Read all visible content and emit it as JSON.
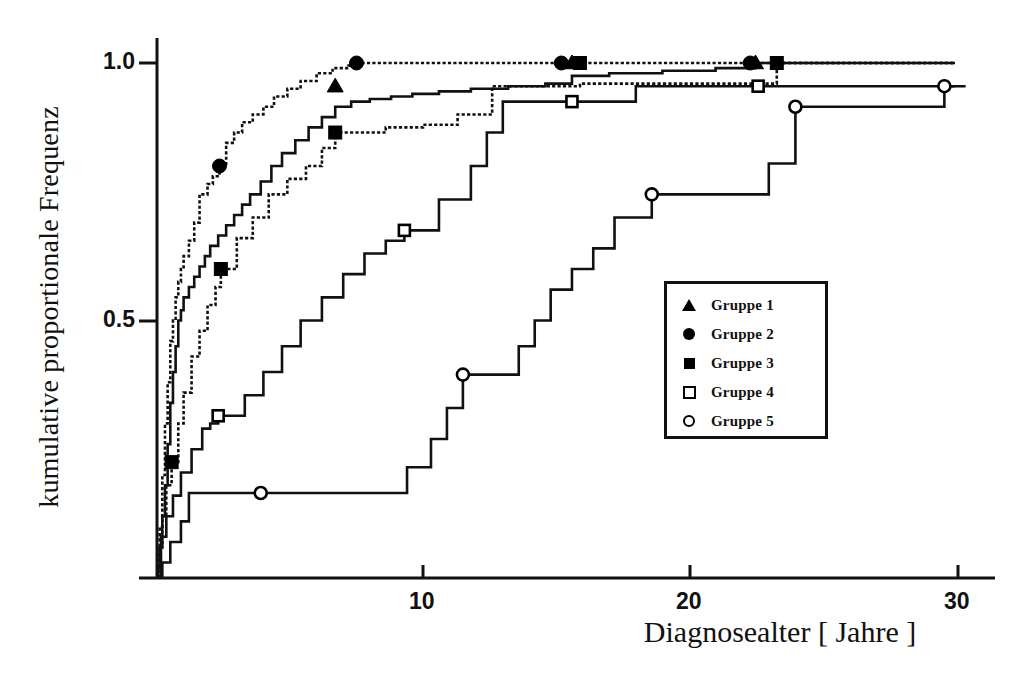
{
  "figure": {
    "title": "",
    "axis": {
      "x_label": "Diagnosealter  [  Jahre  ]",
      "y_label": "kumulative proportionale Frequenz",
      "x_ticks": [
        "10",
        "20",
        "30"
      ],
      "y_ticks": [
        "0.5",
        "1.0"
      ]
    },
    "legend": {
      "items": [
        {
          "label": "Gruppe 1",
          "marker": "filled-triangle-icon"
        },
        {
          "label": "Gruppe 2",
          "marker": "filled-circle-icon"
        },
        {
          "label": "Gruppe 3",
          "marker": "filled-square-icon"
        },
        {
          "label": "Gruppe 4",
          "marker": "open-square-icon"
        },
        {
          "label": "Gruppe 5",
          "marker": "open-circle-icon"
        }
      ]
    }
  },
  "chart_data": {
    "type": "line",
    "title": "",
    "subtitle": "",
    "xlabel": "Diagnosealter  [  Jahre  ]",
    "ylabel": "kumulative proportionale Frequenz",
    "xlim": [
      0,
      31.2
    ],
    "ylim": [
      0,
      1.06
    ],
    "xticks": [
      10,
      20,
      30
    ],
    "yticks": [
      0.5,
      1.0
    ],
    "grid": false,
    "legend_position": "center-right",
    "step_style": "post",
    "series": [
      {
        "name": "Gruppe 1",
        "marker": "filled-triangle",
        "filled": true,
        "line_style": "solid",
        "markers_at": [
          {
            "x": 6.7,
            "y": 0.955
          },
          {
            "x": 15.6,
            "y": 1.0
          },
          {
            "x": 22.5,
            "y": 1.0
          }
        ],
        "x": [
          0.05,
          0.1,
          0.2,
          0.3,
          0.4,
          0.5,
          0.6,
          0.7,
          0.8,
          0.9,
          1.0,
          1.2,
          1.4,
          1.6,
          1.8,
          2.0,
          2.3,
          2.6,
          2.9,
          3.2,
          3.5,
          3.9,
          4.3,
          4.7,
          5.2,
          5.7,
          6.2,
          6.7,
          7.3,
          8.0,
          8.8,
          9.6,
          10.6,
          11.8,
          13.2,
          14.6,
          15.6,
          17.0,
          19.0,
          21.0,
          22.5,
          24.0,
          30.0
        ],
        "y": [
          0.02,
          0.06,
          0.12,
          0.18,
          0.26,
          0.34,
          0.4,
          0.45,
          0.5,
          0.52,
          0.545,
          0.565,
          0.585,
          0.605,
          0.625,
          0.645,
          0.665,
          0.685,
          0.705,
          0.725,
          0.745,
          0.77,
          0.8,
          0.825,
          0.85,
          0.875,
          0.895,
          0.915,
          0.925,
          0.93,
          0.935,
          0.94,
          0.945,
          0.95,
          0.955,
          0.96,
          0.975,
          0.98,
          0.985,
          0.99,
          1.0,
          1.0,
          1.0
        ]
      },
      {
        "name": "Gruppe 2",
        "marker": "filled-circle",
        "filled": true,
        "line_style": "dotted",
        "markers_at": [
          {
            "x": 2.35,
            "y": 0.8
          },
          {
            "x": 7.5,
            "y": 1.0
          },
          {
            "x": 15.2,
            "y": 1.0
          },
          {
            "x": 22.3,
            "y": 1.0
          }
        ],
        "x": [
          0.05,
          0.1,
          0.2,
          0.3,
          0.4,
          0.5,
          0.6,
          0.7,
          0.8,
          0.9,
          1.0,
          1.2,
          1.4,
          1.6,
          1.9,
          2.1,
          2.35,
          2.6,
          2.9,
          3.2,
          3.6,
          4.0,
          4.4,
          4.9,
          5.4,
          6.0,
          6.6,
          7.2,
          7.5,
          9.0,
          12.0,
          15.2,
          18.0,
          22.3,
          30.0
        ],
        "y": [
          0.03,
          0.1,
          0.2,
          0.3,
          0.38,
          0.46,
          0.5,
          0.545,
          0.575,
          0.6,
          0.625,
          0.655,
          0.69,
          0.745,
          0.765,
          0.78,
          0.8,
          0.845,
          0.865,
          0.885,
          0.9,
          0.915,
          0.935,
          0.95,
          0.965,
          0.98,
          0.99,
          0.995,
          1.0,
          1.0,
          1.0,
          1.0,
          1.0,
          1.0,
          1.0
        ]
      },
      {
        "name": "Gruppe 3",
        "marker": "filled-square",
        "filled": true,
        "line_style": "dotted",
        "markers_at": [
          {
            "x": 0.55,
            "y": 0.225
          },
          {
            "x": 2.4,
            "y": 0.6
          },
          {
            "x": 6.7,
            "y": 0.865
          },
          {
            "x": 15.9,
            "y": 1.0
          },
          {
            "x": 23.3,
            "y": 1.0
          }
        ],
        "x": [
          0.05,
          0.2,
          0.35,
          0.55,
          0.8,
          1.0,
          1.3,
          1.6,
          1.9,
          2.2,
          2.4,
          3.0,
          3.6,
          4.2,
          4.9,
          5.6,
          6.2,
          6.7,
          8.6,
          10.0,
          11.3,
          12.6,
          15.9,
          18.0,
          23.3,
          30.0
        ],
        "y": [
          0.06,
          0.12,
          0.18,
          0.225,
          0.3,
          0.36,
          0.43,
          0.48,
          0.53,
          0.565,
          0.6,
          0.66,
          0.7,
          0.745,
          0.775,
          0.8,
          0.835,
          0.865,
          0.875,
          0.88,
          0.9,
          0.955,
          0.96,
          0.96,
          1.0,
          1.0
        ]
      },
      {
        "name": "Gruppe 4",
        "marker": "open-square",
        "filled": false,
        "line_style": "solid",
        "markers_at": [
          {
            "x": 2.3,
            "y": 0.315
          },
          {
            "x": 9.3,
            "y": 0.675
          },
          {
            "x": 15.6,
            "y": 0.925
          },
          {
            "x": 22.6,
            "y": 0.955
          }
        ],
        "x": [
          0.15,
          0.35,
          0.6,
          0.9,
          1.3,
          1.7,
          2.0,
          2.3,
          3.3,
          4.0,
          4.7,
          5.4,
          6.2,
          7.0,
          7.8,
          8.6,
          9.3,
          10.6,
          11.8,
          12.4,
          13.0,
          15.6,
          17.3,
          18.0,
          22.6,
          30.0
        ],
        "y": [
          0.08,
          0.12,
          0.16,
          0.205,
          0.25,
          0.29,
          0.3,
          0.315,
          0.355,
          0.4,
          0.45,
          0.5,
          0.545,
          0.59,
          0.63,
          0.655,
          0.675,
          0.735,
          0.8,
          0.865,
          0.925,
          0.925,
          0.925,
          0.955,
          0.955,
          0.955
        ]
      },
      {
        "name": "Gruppe 5",
        "marker": "open-circle",
        "filled": false,
        "line_style": "solid",
        "markers_at": [
          {
            "x": 3.9,
            "y": 0.165
          },
          {
            "x": 11.5,
            "y": 0.395
          },
          {
            "x": 18.6,
            "y": 0.745
          },
          {
            "x": 24.0,
            "y": 0.915
          },
          {
            "x": 29.6,
            "y": 0.955
          }
        ],
        "x": [
          0.2,
          0.5,
          0.9,
          1.2,
          3.9,
          8.5,
          9.4,
          10.3,
          10.9,
          11.5,
          13.0,
          13.6,
          14.2,
          14.8,
          15.6,
          16.4,
          17.2,
          18.6,
          21.0,
          23.0,
          24.0,
          28.0,
          29.6,
          30.4
        ],
        "y": [
          0.03,
          0.07,
          0.11,
          0.165,
          0.165,
          0.165,
          0.215,
          0.27,
          0.33,
          0.395,
          0.395,
          0.45,
          0.5,
          0.56,
          0.6,
          0.64,
          0.7,
          0.745,
          0.745,
          0.805,
          0.915,
          0.915,
          0.955,
          0.955
        ]
      }
    ]
  }
}
